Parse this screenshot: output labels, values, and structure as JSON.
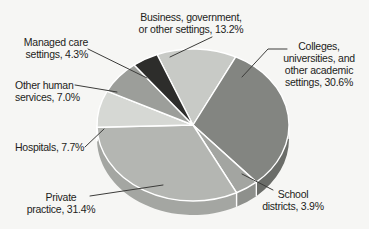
{
  "figure": {
    "background_color": "#f6f6f4",
    "text_color": "#1d1d1b"
  },
  "chart_data": {
    "type": "pie",
    "style": "3d",
    "unit": "%",
    "direction": "clockwise",
    "start_angle_deg": 112,
    "separator_color": "#ffffff",
    "leader_line_color": "#3c3c3a",
    "slices": [
      {
        "id": "business",
        "name": "Business, government, or other settings",
        "value": 13.2,
        "color": "#c8cac6",
        "side_color": "#abada9",
        "label_lines": [
          "Business, government,",
          "or other settings, 13.2%"
        ]
      },
      {
        "id": "colleges",
        "name": "Colleges, universities, and other academic settings",
        "value": 30.6,
        "color": "#838581",
        "side_color": "#6b6d69",
        "label_lines": [
          "Colleges,",
          "universities, and",
          "other academic",
          "settings, 30.6%"
        ]
      },
      {
        "id": "school",
        "name": "School districts",
        "value": 3.9,
        "color": "#a3a5a1",
        "side_color": "#8e908c",
        "label_lines": [
          "School",
          "districts, 3.9%"
        ]
      },
      {
        "id": "private",
        "name": "Private practice",
        "value": 31.4,
        "color": "#b4b6b2",
        "side_color": "#a4a6a2",
        "label_lines": [
          "Private",
          "practice, 31.4%"
        ]
      },
      {
        "id": "hospitals",
        "name": "Hospitals",
        "value": 7.7,
        "color": "#d6d8d4",
        "side_color": "#bdbfbb",
        "label_lines": [
          "Hospitals, 7.7%"
        ]
      },
      {
        "id": "other_human",
        "name": "Other human services",
        "value": 7.0,
        "color": "#9c9e9a",
        "side_color": "#898b87",
        "label_lines": [
          "Other human",
          "services, 7.0%"
        ]
      },
      {
        "id": "managed",
        "name": "Managed care settings",
        "value": 4.3,
        "color": "#2d2d2b",
        "side_color": "#222220",
        "label_lines": [
          "Managed care",
          "settings, 4.3%"
        ]
      }
    ]
  }
}
